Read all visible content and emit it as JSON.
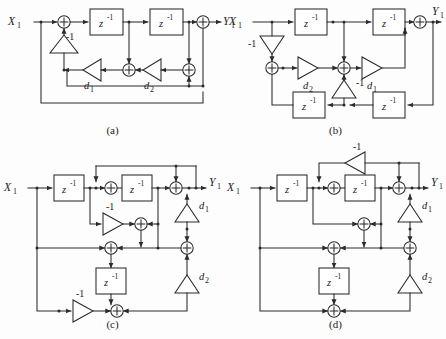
{
  "figure": {
    "kind": "signal-flow-block-diagram-set",
    "background_color": "#fdfdfd",
    "line_color": "#2b2b2b",
    "panel_count": 4,
    "panels": [
      {
        "id": "a",
        "caption": "(a)",
        "input_label": "X",
        "input_sub": "1",
        "output_label": "Y",
        "output_sub": "1",
        "delay_label": "z",
        "delay_exp": "-1",
        "delay_count": 2,
        "adder_count": 4,
        "gains": [
          {
            "name": "neg-one-gain",
            "label": "-1",
            "orientation": "up"
          },
          {
            "name": "d1-gain",
            "label": "d",
            "sub": "1",
            "orientation": "left"
          },
          {
            "name": "d2-gain",
            "label": "d",
            "sub": "2",
            "orientation": "left"
          }
        ]
      },
      {
        "id": "b",
        "caption": "(b)",
        "input_label": "X",
        "input_sub": "1",
        "output_label": "Y",
        "output_sub": "1",
        "delay_label": "z",
        "delay_exp": "-1",
        "delay_count": 4,
        "adder_count": 3,
        "gains": [
          {
            "name": "neg-one-gain-top",
            "label": "-1",
            "orientation": "down"
          },
          {
            "name": "d2-gain",
            "label": "d",
            "sub": "2",
            "orientation": "right"
          },
          {
            "name": "neg-one-gain-mid",
            "label": "-1",
            "orientation": "up"
          },
          {
            "name": "d1-gain",
            "label": "d",
            "sub": "1",
            "orientation": "right"
          }
        ]
      },
      {
        "id": "c",
        "caption": "(c)",
        "input_label": "X",
        "input_sub": "1",
        "output_label": "Y",
        "output_sub": "1",
        "delay_label": "z",
        "delay_exp": "-1",
        "delay_count": 3,
        "adder_count": 6,
        "gains": [
          {
            "name": "neg-one-gain-upper",
            "label": "-1",
            "orientation": "right"
          },
          {
            "name": "d1-gain",
            "label": "d",
            "sub": "1",
            "orientation": "up"
          },
          {
            "name": "d2-gain",
            "label": "d",
            "sub": "2",
            "orientation": "up"
          },
          {
            "name": "neg-one-gain-lower",
            "label": "-1",
            "orientation": "right"
          }
        ]
      },
      {
        "id": "d",
        "caption": "(d)",
        "input_label": "X",
        "input_sub": "1",
        "output_label": "Y",
        "output_sub": "1",
        "delay_label": "z",
        "delay_exp": "-1",
        "delay_count": 3,
        "adder_count": 6,
        "gains": [
          {
            "name": "neg-one-gain-top",
            "label": "-1",
            "orientation": "left"
          },
          {
            "name": "d1-gain",
            "label": "d",
            "sub": "1",
            "orientation": "up"
          },
          {
            "name": "d2-gain",
            "label": "d",
            "sub": "2",
            "orientation": "up"
          }
        ]
      }
    ]
  }
}
